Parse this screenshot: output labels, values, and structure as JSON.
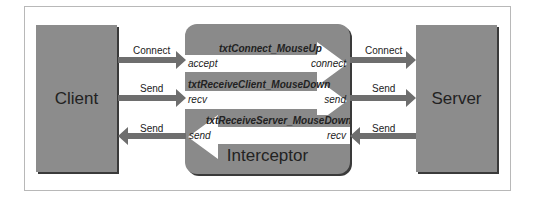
{
  "client": {
    "label": "Client"
  },
  "server": {
    "label": "Server"
  },
  "interceptor": {
    "label": "Interceptor",
    "channels": [
      {
        "handler": "txtConnect_MouseUp",
        "left": "accept",
        "right": "connect",
        "direction": "right"
      },
      {
        "handler": "txtReceiveClient_MouseDown",
        "left": "recv",
        "right": "send",
        "direction": "right"
      },
      {
        "handler": "txtReceiveServer_MouseDown",
        "left": "send",
        "right": "recv",
        "direction": "left"
      }
    ]
  },
  "arrows": {
    "client_to_int_connect": "Connect",
    "client_to_int_send": "Send",
    "int_to_client_send": "Send",
    "int_to_server_connect": "Connect",
    "int_to_server_send": "Send",
    "server_to_int_send": "Send"
  },
  "colors": {
    "box": "#8c8c8c",
    "shadow": "#3a3a3a",
    "arrow": "#6e6e6e",
    "band": "#ffffff"
  }
}
